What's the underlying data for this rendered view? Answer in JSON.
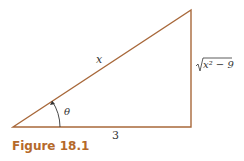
{
  "figure": {
    "caption": "Figure 18.1",
    "labels": {
      "hypotenuse": "x",
      "adjacent": "3",
      "opposite_radicand": "x² − 9",
      "angle": "θ"
    },
    "colors": {
      "stroke": "#a8683a",
      "caption": "#b5692a"
    }
  }
}
